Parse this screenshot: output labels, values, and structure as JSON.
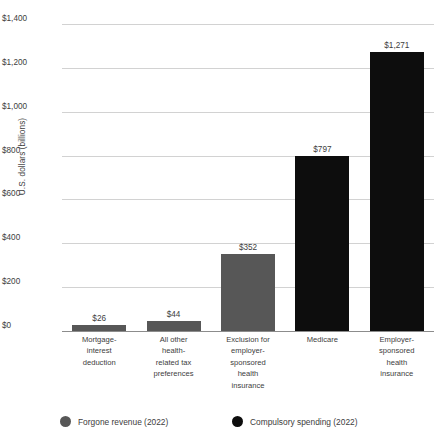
{
  "chart_data": {
    "type": "bar",
    "title": "",
    "xlabel": "",
    "ylabel": "U.S. dollars (billions)",
    "ylim": [
      0,
      1400
    ],
    "ytick_values": [
      0,
      200,
      400,
      600,
      800,
      1000,
      1200,
      1400
    ],
    "ytick_labels": [
      "$0",
      "$200",
      "$400",
      "$600",
      "$800",
      "$1,000",
      "$1,200",
      "$1,400"
    ],
    "grid": true,
    "legend_position": "bottom",
    "categories": [
      "Mortgage-interest deduction",
      "All other health-related tax preferences",
      "Exclusion for employer-sponsored health insurance",
      "Medicare",
      "Employer-sponsored health insurance"
    ],
    "values": [
      26,
      352,
      797,
      1271,
      44
    ],
    "bars": [
      {
        "category": "Mortgage-interest deduction",
        "label_lines": [
          "Mortgage-",
          "interest",
          "deduction"
        ],
        "value": 26,
        "value_label": "$26",
        "series": "Forgone revenue (2022)",
        "color": "#575757"
      },
      {
        "category": "All other health-related tax preferences",
        "label_lines": [
          "All other",
          "health-",
          "related tax",
          "preferences"
        ],
        "value": 44,
        "value_label": "$44",
        "series": "Forgone revenue (2022)",
        "color": "#575757"
      },
      {
        "category": "Exclusion for employer-sponsored health insurance",
        "label_lines": [
          "Exclusion for",
          "employer-",
          "sponsored",
          "health",
          "insurance"
        ],
        "value": 352,
        "value_label": "$352",
        "series": "Forgone revenue (2022)",
        "color": "#575757"
      },
      {
        "category": "Medicare",
        "label_lines": [
          "Medicare"
        ],
        "value": 797,
        "value_label": "$797",
        "series": "Compulsory spending (2022)",
        "color": "#0d0d0d"
      },
      {
        "category": "Employer-sponsored health insurance",
        "label_lines": [
          "Employer-",
          "sponsored",
          "health",
          "insurance"
        ],
        "value": 1271,
        "value_label": "$1,271",
        "series": "Compulsory spending (2022)",
        "color": "#0d0d0d"
      }
    ],
    "series": [
      {
        "name": "Forgone revenue (2022)",
        "color": "#575757",
        "values": [
          26,
          44,
          352,
          null,
          null
        ]
      },
      {
        "name": "Compulsory spending (2022)",
        "color": "#0d0d0d",
        "values": [
          null,
          null,
          null,
          797,
          1271
        ]
      }
    ],
    "legend": [
      {
        "label": "Forgone revenue (2022)",
        "color": "#575757"
      },
      {
        "label": "Compulsory spending (2022)",
        "color": "#0d0d0d"
      }
    ]
  }
}
